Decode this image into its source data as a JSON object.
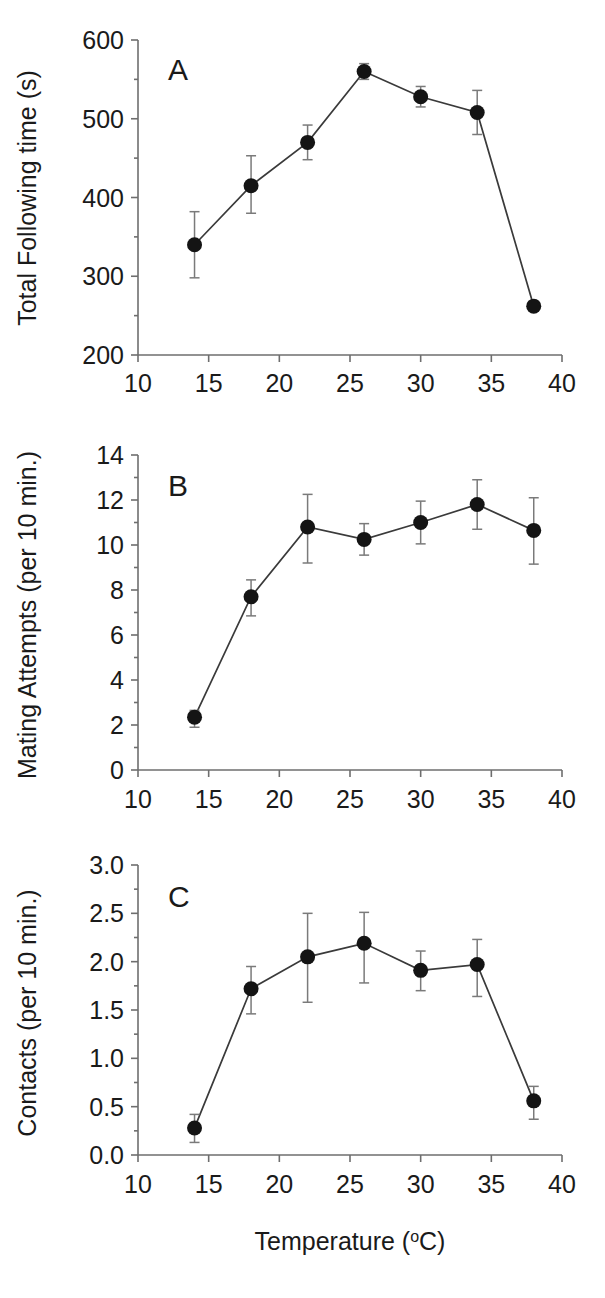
{
  "figure": {
    "panels": [
      "A",
      "B",
      "C"
    ],
    "x_axis_label": "Temperature (",
    "x_axis_label_sup": "o",
    "x_axis_label_tail": "C)",
    "x_axis_label_full": "Temperature (oC)"
  },
  "chart_data": [
    {
      "type": "line",
      "panel": "A",
      "title": "A",
      "xlabel": "",
      "ylabel": "Total Following time (s)",
      "x": [
        14,
        18,
        22,
        26,
        30,
        34,
        38
      ],
      "values": [
        340,
        415,
        470,
        560,
        528,
        508,
        262
      ],
      "error_plus": [
        42,
        38,
        22,
        10,
        13,
        28,
        0
      ],
      "error_minus": [
        42,
        35,
        22,
        10,
        13,
        28,
        0
      ],
      "xlim": [
        10,
        40
      ],
      "ylim": [
        200,
        600
      ],
      "xticks": [
        10,
        15,
        20,
        25,
        30,
        35,
        40
      ],
      "yticks": [
        200,
        300,
        400,
        500,
        600
      ],
      "ytick_labels": [
        "200",
        "300",
        "400",
        "500",
        "600"
      ],
      "xtick_labels": [
        "10",
        "15",
        "20",
        "25",
        "30",
        "35",
        "40"
      ],
      "grid": false,
      "legend": false,
      "marker": "filled-circle"
    },
    {
      "type": "line",
      "panel": "B",
      "title": "B",
      "xlabel": "",
      "ylabel": "Mating Attempts (per 10 min.)",
      "x": [
        14,
        18,
        22,
        26,
        30,
        34,
        38
      ],
      "values": [
        2.35,
        7.7,
        10.8,
        10.25,
        11.0,
        11.8,
        10.65
      ],
      "error_plus": [
        0.3,
        0.75,
        1.45,
        0.7,
        0.95,
        1.1,
        1.45
      ],
      "error_minus": [
        0.45,
        0.85,
        1.6,
        0.7,
        0.95,
        1.1,
        1.5
      ],
      "xlim": [
        10,
        40
      ],
      "ylim": [
        0,
        14
      ],
      "xticks": [
        10,
        15,
        20,
        25,
        30,
        35,
        40
      ],
      "yticks": [
        0,
        2,
        4,
        6,
        8,
        10,
        12,
        14
      ],
      "ytick_labels": [
        "0",
        "2",
        "4",
        "6",
        "8",
        "10",
        "12",
        "14"
      ],
      "xtick_labels": [
        "10",
        "15",
        "20",
        "25",
        "30",
        "35",
        "40"
      ],
      "grid": false,
      "legend": false,
      "marker": "filled-circle"
    },
    {
      "type": "line",
      "panel": "C",
      "title": "C",
      "xlabel": "Temperature (oC)",
      "ylabel": "Contacts (per 10 min.)",
      "x": [
        14,
        18,
        22,
        26,
        30,
        34,
        38
      ],
      "values": [
        0.28,
        1.72,
        2.05,
        2.19,
        1.91,
        1.97,
        0.56
      ],
      "error_plus": [
        0.14,
        0.23,
        0.45,
        0.32,
        0.2,
        0.26,
        0.15
      ],
      "error_minus": [
        0.15,
        0.26,
        0.47,
        0.41,
        0.21,
        0.33,
        0.19
      ],
      "xlim": [
        10,
        40
      ],
      "ylim": [
        0,
        3
      ],
      "xticks": [
        10,
        15,
        20,
        25,
        30,
        35,
        40
      ],
      "yticks": [
        0,
        0.5,
        1,
        1.5,
        2,
        2.5,
        3
      ],
      "ytick_labels": [
        "0.0",
        "0.5",
        "1.0",
        "1.5",
        "2.0",
        "2.5",
        "3.0"
      ],
      "xtick_labels": [
        "10",
        "15",
        "20",
        "25",
        "30",
        "35",
        "40"
      ],
      "grid": false,
      "legend": false,
      "marker": "filled-circle"
    }
  ],
  "colors": {
    "marker": "#141414",
    "line": "#3a3a3a",
    "axis": "#6e6e6e",
    "errorbar": "#7a7a7a",
    "text": "#1a1a1a",
    "background": "#ffffff"
  }
}
